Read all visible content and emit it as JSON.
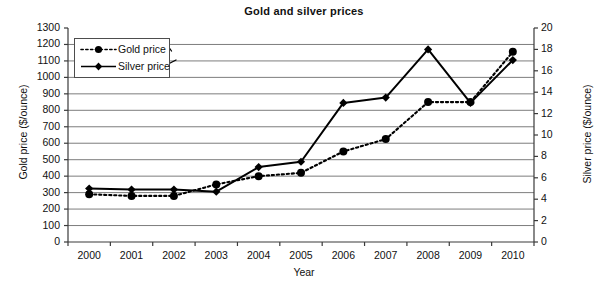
{
  "chart_data": {
    "type": "line",
    "title": "Gold and silver prices",
    "xlabel": "Year",
    "ylabel": "Gold price ($/ounce)",
    "y2label": "Silver price ($/ounce)",
    "categories": [
      "2000",
      "2001",
      "2002",
      "2003",
      "2004",
      "2005",
      "2006",
      "2007",
      "2008",
      "2009",
      "2010"
    ],
    "ylim": [
      0,
      1300
    ],
    "ytick_step": 100,
    "yticks": [
      1300,
      1200,
      1100,
      1000,
      900,
      800,
      700,
      600,
      500,
      400,
      300,
      200,
      100,
      0
    ],
    "y2lim": [
      0,
      20
    ],
    "y2tick_step": 2,
    "y2ticks": [
      20,
      18,
      16,
      14,
      12,
      10,
      8,
      6,
      4,
      2,
      0
    ],
    "grid": true,
    "grid_axis": "y",
    "legend_position": "upper left",
    "series": [
      {
        "name": "Gold price",
        "axis": "left",
        "unit": "$/ounce",
        "line_style": "dotted",
        "marker": "circle",
        "color": "#000000",
        "values": [
          290,
          280,
          280,
          350,
          400,
          420,
          550,
          625,
          850,
          850,
          1155
        ]
      },
      {
        "name": "Silver price",
        "axis": "right",
        "unit": "$/ounce",
        "line_style": "solid",
        "marker": "diamond",
        "color": "#000000",
        "values": [
          5.0,
          4.9,
          4.9,
          4.7,
          7.0,
          7.5,
          13.0,
          13.5,
          18.0,
          13.0,
          17.0
        ]
      }
    ],
    "annotations": [
      {
        "name": "gold-legend-arrow",
        "target": "left axis",
        "shape": "arrow-up-right"
      },
      {
        "name": "silver-legend-arrow",
        "target": "right axis",
        "shape": "arrow-down-right"
      }
    ]
  },
  "legend": {
    "items": [
      {
        "label": "Gold price"
      },
      {
        "label": "Silver price"
      }
    ]
  }
}
